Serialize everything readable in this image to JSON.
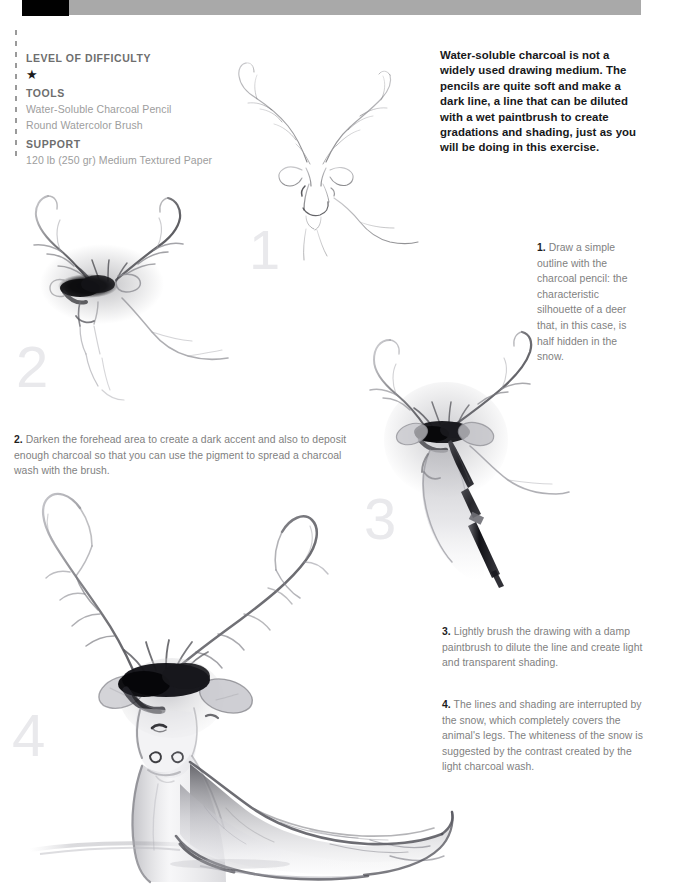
{
  "topbar": {
    "black_block": "#010101",
    "gray_block": "#a9a9a9"
  },
  "sidebar": {
    "difficulty_heading": "LEVEL OF DIFFICULTY",
    "difficulty_stars": "★",
    "difficulty_rating": 1,
    "tools_heading": "TOOLS",
    "tools": [
      "Water-Soluble Charcoal Pencil",
      "Round Watercolor Brush"
    ],
    "support_heading": "SUPPORT",
    "support": [
      "120 lb (250 gr) Medium Textured Paper"
    ]
  },
  "intro": "Water-soluble charcoal is not a widely used drawing medium. The pencils are quite soft and make a dark line, a line that can be diluted with a wet paintbrush to create gradations and shading, just as you will be doing in this exercise.",
  "steps": [
    {
      "number": "1",
      "label": "1.",
      "text": "Draw a simple outline with the charcoal pencil: the characteristic silhouette of a deer that, in this case, is half hidden in the snow.",
      "artwork": "deer-outline-sketch"
    },
    {
      "number": "2",
      "label": "2.",
      "text": "Darken the forehead area to create a dark accent and also to deposit enough charcoal so that you can use the pigment to spread a charcoal wash with the brush.",
      "artwork": "deer-darkened-forehead"
    },
    {
      "number": "3",
      "label": "3.",
      "text": "Lightly brush the drawing with a damp paintbrush to dilute the line and create light and transparent shading.",
      "artwork": "deer-with-paintbrush"
    },
    {
      "number": "4",
      "label": "4.",
      "text": "The lines and shading are interrupted by the snow, which completely covers the animal's legs. The whiteness of the snow is suggested by the contrast created by the light charcoal wash.",
      "artwork": "deer-finished-in-snow"
    }
  ],
  "colors": {
    "heading_gray": "#6e6e6e",
    "list_gray": "#9d9d9d",
    "caption_gray": "#7f7f7f",
    "caption_bold": "#1d1d1d",
    "intro_black": "#17181a",
    "ghost_numeral": "#e9e9ec",
    "charcoal_dark": "#1a1a1a",
    "charcoal_mid": "#8a8a8e",
    "charcoal_light": "#cfcfd4",
    "page_background": "#ffffff"
  }
}
